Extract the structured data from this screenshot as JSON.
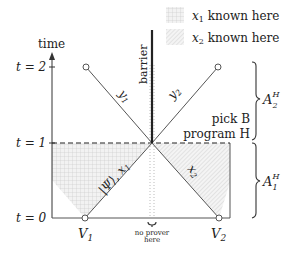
{
  "legend": {
    "items": [
      {
        "pattern": "grid",
        "label_var": "x",
        "label_sub": "1",
        "label_text": " known here"
      },
      {
        "pattern": "hatch",
        "label_var": "x",
        "label_sub": "2",
        "label_text": " known here"
      }
    ]
  },
  "axis": {
    "label": "time",
    "ticks": [
      {
        "label": "t = 2",
        "t": 2
      },
      {
        "label": "t = 1",
        "t": 1
      },
      {
        "label": "t = 0",
        "t": 0
      }
    ]
  },
  "verifiers": [
    {
      "label": "V",
      "sub": "1"
    },
    {
      "label": "V",
      "sub": "2"
    }
  ],
  "lines": {
    "y1_label_var": "y",
    "y1_label_sub": "1",
    "y2_label_var": "y",
    "y2_label_sub": "2",
    "psi_x1_label": "|Ψ⟩, x",
    "psi_x1_sub": "1",
    "x2_label_var": "x",
    "x2_label_sub": "2"
  },
  "barrier": {
    "label": "barrier"
  },
  "annotations": {
    "pick_b": "pick B",
    "program_h": "program H",
    "no_prover_line1": "no prover",
    "no_prover_line2": "here"
  },
  "braces": [
    {
      "label": "A",
      "sup": "H",
      "sub": "2"
    },
    {
      "label": "A",
      "sup": "H",
      "sub": "1"
    }
  ],
  "colors": {
    "line": "#555555",
    "barrier": "#222222",
    "fill": "#eeeeee",
    "grid": "#c8c8c8"
  }
}
